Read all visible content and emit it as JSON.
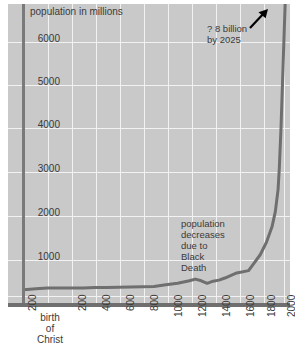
{
  "chart_data": {
    "type": "line",
    "title": "",
    "ylabel": "population in millions",
    "xlabel": "",
    "ylim": [
      0,
      6800
    ],
    "xlim": [
      -200,
      2060
    ],
    "grid": true,
    "legend": null,
    "y_ticks": [
      "1000",
      "2000",
      "3000",
      "4000",
      "5000",
      "6000"
    ],
    "y_tick_values": [
      1000,
      2000,
      3000,
      4000,
      5000,
      6000
    ],
    "x_ticks": [
      "200",
      "birth\nof\nChrist",
      "200",
      "400",
      "600",
      "800",
      "1000",
      "1200",
      "1400",
      "1600",
      "1800",
      "2000"
    ],
    "x_tick_values": [
      -200,
      0,
      200,
      400,
      600,
      800,
      1000,
      1200,
      1400,
      1600,
      1800,
      2000
    ],
    "series": [
      {
        "name": "world population",
        "x": [
          -200,
          -100,
          0,
          100,
          200,
          300,
          400,
          500,
          600,
          700,
          800,
          900,
          1000,
          1100,
          1200,
          1250,
          1300,
          1350,
          1400,
          1450,
          1500,
          1600,
          1700,
          1750,
          1800,
          1850,
          1900,
          1927,
          1950,
          1960,
          1975,
          1987,
          2000,
          2011,
          2025
        ],
        "values": [
          150,
          170,
          190,
          190,
          190,
          190,
          200,
          200,
          205,
          210,
          220,
          225,
          265,
          300,
          360,
          400,
          360,
          300,
          350,
          375,
          425,
          545,
          600,
          790,
          980,
          1260,
          1650,
          2000,
          2520,
          3000,
          4000,
          5000,
          6100,
          7000,
          8000
        ]
      }
    ],
    "annotations": [
      {
        "id": "future",
        "text": "? 8 billion\nby 2025",
        "arrow": true
      },
      {
        "id": "plague",
        "text": "population\ndecreases\ndue to\nBlack\nDeath",
        "arrow": false
      }
    ],
    "colors": {
      "panel": "#c9c9c9",
      "grid": "#f2f2f2",
      "curve": "#6f6f6f",
      "axis": "#6f6f6f",
      "text": "#3a3a3a",
      "arrow": "#000000",
      "background": "#ffffff"
    }
  }
}
